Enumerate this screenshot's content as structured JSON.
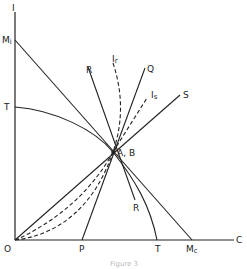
{
  "figure": {
    "axes": {
      "y_label": "I",
      "x_label": "C",
      "origin_label": "O"
    },
    "labels": {
      "Mi": "M",
      "Mi_sub": "i",
      "Mc": "M",
      "Mc_sub": "c",
      "T_y": "T",
      "T_x": "T",
      "P": "P",
      "R_top": "R",
      "R_bottom": "R",
      "Q": "Q",
      "S": "S",
      "Ir": "I",
      "Ir_sub": "r",
      "Is": "I",
      "Is_sub": "s",
      "AB": "A, B"
    },
    "caption": "Figure 3"
  }
}
